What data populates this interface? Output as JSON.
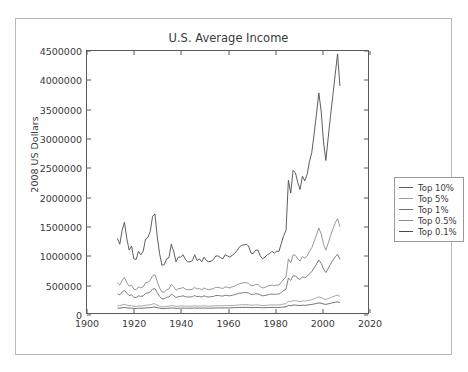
{
  "clipped_header_text": "",
  "chart_data": {
    "type": "line",
    "title": "U.S. Average Income",
    "xlabel": "",
    "ylabel": "2008 US Dollars",
    "xlim": [
      1900,
      2020
    ],
    "ylim": [
      0,
      4500000
    ],
    "xticks": [
      1900,
      1920,
      1940,
      1960,
      1980,
      2000,
      2020
    ],
    "yticks": [
      0,
      500000,
      1000000,
      1500000,
      2000000,
      2500000,
      3000000,
      3500000,
      4000000,
      4500000
    ],
    "grid": false,
    "legend_position": "right-outside",
    "x": [
      1913,
      1914,
      1915,
      1916,
      1917,
      1918,
      1919,
      1920,
      1921,
      1922,
      1923,
      1924,
      1925,
      1926,
      1927,
      1928,
      1929,
      1930,
      1931,
      1932,
      1933,
      1934,
      1935,
      1936,
      1937,
      1938,
      1939,
      1940,
      1941,
      1942,
      1943,
      1944,
      1945,
      1946,
      1947,
      1948,
      1949,
      1950,
      1951,
      1952,
      1953,
      1954,
      1955,
      1956,
      1957,
      1958,
      1959,
      1960,
      1961,
      1962,
      1963,
      1964,
      1965,
      1966,
      1967,
      1968,
      1969,
      1970,
      1971,
      1972,
      1973,
      1974,
      1975,
      1976,
      1977,
      1978,
      1979,
      1980,
      1981,
      1982,
      1983,
      1984,
      1985,
      1986,
      1987,
      1988,
      1989,
      1990,
      1991,
      1992,
      1993,
      1994,
      1995,
      1996,
      1997,
      1998,
      1999,
      2000,
      2001,
      2002,
      2003,
      2004,
      2005,
      2006,
      2007,
      2008
    ],
    "series": [
      {
        "name": "Top 0.1%",
        "color": "#4a4a4a",
        "values": [
          1280000,
          1180000,
          1420000,
          1560000,
          1280000,
          1080000,
          1150000,
          930000,
          920000,
          1060000,
          1000000,
          1060000,
          1270000,
          1300000,
          1400000,
          1660000,
          1700000,
          1310000,
          1020000,
          820000,
          830000,
          930000,
          950000,
          1180000,
          1060000,
          880000,
          960000,
          960000,
          1000000,
          920000,
          880000,
          880000,
          900000,
          1000000,
          900000,
          930000,
          880000,
          960000,
          900000,
          880000,
          890000,
          920000,
          980000,
          980000,
          950000,
          930000,
          1000000,
          980000,
          960000,
          990000,
          1020000,
          1070000,
          1130000,
          1160000,
          1170000,
          1180000,
          1150000,
          1030000,
          1020000,
          1080000,
          1080000,
          980000,
          930000,
          960000,
          1000000,
          1020000,
          1060000,
          1030000,
          1060000,
          1060000,
          1200000,
          1330000,
          1420000,
          2280000,
          2060000,
          2450000,
          2410000,
          2240000,
          2120000,
          2350000,
          2270000,
          2380000,
          2600000,
          2760000,
          3080000,
          3420000,
          3780000,
          3470000,
          2940000,
          2620000,
          3010000,
          3390000,
          3740000,
          4100000,
          4450000,
          3900000
        ]
      },
      {
        "name": "Top 0.5%",
        "color": "#8a8a8a",
        "values": [
          520000,
          480000,
          560000,
          610000,
          520000,
          460000,
          480000,
          410000,
          400000,
          450000,
          430000,
          450000,
          520000,
          530000,
          560000,
          640000,
          660000,
          540000,
          430000,
          360000,
          360000,
          400000,
          410000,
          490000,
          450000,
          390000,
          420000,
          420000,
          440000,
          410000,
          400000,
          400000,
          410000,
          440000,
          410000,
          420000,
          400000,
          430000,
          410000,
          400000,
          410000,
          420000,
          440000,
          440000,
          430000,
          420000,
          450000,
          440000,
          430000,
          450000,
          460000,
          480000,
          500000,
          510000,
          520000,
          520000,
          510000,
          470000,
          470000,
          490000,
          490000,
          450000,
          430000,
          440000,
          460000,
          470000,
          480000,
          470000,
          480000,
          480000,
          530000,
          580000,
          620000,
          930000,
          860000,
          1000000,
          990000,
          930000,
          890000,
          970000,
          940000,
          980000,
          1060000,
          1120000,
          1230000,
          1340000,
          1460000,
          1360000,
          1180000,
          1080000,
          1200000,
          1330000,
          1440000,
          1550000,
          1620000,
          1480000
        ]
      },
      {
        "name": "Top 1%",
        "color": "#6f6f6f",
        "values": [
          330000,
          310000,
          360000,
          390000,
          340000,
          300000,
          310000,
          270000,
          265000,
          295000,
          285000,
          295000,
          335000,
          345000,
          360000,
          410000,
          420000,
          350000,
          285000,
          245000,
          245000,
          270000,
          275000,
          325000,
          300000,
          265000,
          280000,
          285000,
          295000,
          280000,
          275000,
          275000,
          280000,
          300000,
          280000,
          285000,
          275000,
          295000,
          280000,
          275000,
          280000,
          285000,
          300000,
          300000,
          295000,
          290000,
          305000,
          300000,
          295000,
          305000,
          315000,
          325000,
          340000,
          345000,
          350000,
          350000,
          345000,
          320000,
          320000,
          330000,
          330000,
          310000,
          295000,
          300000,
          310000,
          320000,
          325000,
          320000,
          325000,
          325000,
          355000,
          385000,
          410000,
          600000,
          560000,
          640000,
          635000,
          600000,
          575000,
          620000,
          605000,
          630000,
          675000,
          710000,
          775000,
          840000,
          910000,
          855000,
          755000,
          695000,
          765000,
          840000,
          905000,
          965000,
          1010000,
          920000
        ]
      },
      {
        "name": "Top 5%",
        "color": "#9d9d9d",
        "values": [
          130000,
          125000,
          140000,
          150000,
          135000,
          125000,
          128000,
          115000,
          113000,
          122000,
          120000,
          122000,
          133000,
          136000,
          140000,
          155000,
          158000,
          138000,
          120000,
          107000,
          107000,
          114000,
          116000,
          130000,
          123000,
          113000,
          118000,
          120000,
          123000,
          119000,
          117000,
          117000,
          119000,
          125000,
          119000,
          121000,
          118000,
          124000,
          120000,
          118000,
          120000,
          122000,
          126000,
          126000,
          125000,
          123000,
          128000,
          127000,
          126000,
          129000,
          132000,
          135000,
          139000,
          141000,
          143000,
          143000,
          142000,
          135000,
          135000,
          138000,
          138000,
          133000,
          129000,
          131000,
          134000,
          137000,
          139000,
          137000,
          138000,
          138000,
          146000,
          154000,
          160000,
          202000,
          194000,
          212000,
          211000,
          203000,
          197000,
          208000,
          205000,
          211000,
          222000,
          230000,
          246000,
          262000,
          278000,
          266000,
          243000,
          229000,
          247000,
          265000,
          281000,
          296000,
          307000,
          285000
        ]
      },
      {
        "name": "Top 10%",
        "color": "#5e5e5e",
        "values": [
          86000,
          83000,
          90000,
          96000,
          89000,
          84000,
          85000,
          79000,
          78000,
          83000,
          82000,
          83000,
          88000,
          90000,
          92000,
          99000,
          101000,
          92000,
          83000,
          76000,
          76000,
          80000,
          81000,
          88000,
          84000,
          79000,
          82000,
          83000,
          85000,
          83000,
          82000,
          82000,
          83000,
          86000,
          83000,
          84000,
          83000,
          86000,
          84000,
          83000,
          84000,
          85000,
          87000,
          87000,
          87000,
          86000,
          89000,
          88000,
          88000,
          90000,
          91000,
          93000,
          95000,
          96000,
          97000,
          97000,
          97000,
          93000,
          93000,
          95000,
          95000,
          92000,
          90000,
          91000,
          93000,
          95000,
          96000,
          95000,
          95000,
          95000,
          99000,
          103000,
          107000,
          130000,
          126000,
          136000,
          136000,
          131000,
          128000,
          134000,
          132000,
          136000,
          142000,
          147000,
          155000,
          164000,
          173000,
          167000,
          155000,
          148000,
          158000,
          168000,
          177000,
          185000,
          191000,
          180000
        ]
      }
    ]
  }
}
